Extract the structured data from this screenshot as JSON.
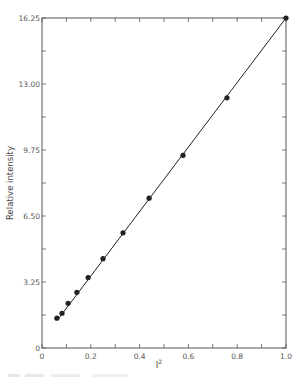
{
  "chart_data": {
    "type": "scatter",
    "title": "",
    "xlabel": "I",
    "xlabel_superscript": "2",
    "ylabel": "Relative intensity",
    "xlim": [
      0,
      1.0
    ],
    "ylim": [
      0,
      16.25
    ],
    "grid": false,
    "legend": null,
    "x_ticks": [
      0,
      0.1,
      0.2,
      0.3,
      0.4,
      0.5,
      0.6,
      0.7,
      0.8,
      0.9,
      1.0
    ],
    "x_tick_labels": [
      "0",
      "0.2",
      "0.4",
      "0.6",
      "0.8",
      "1.0"
    ],
    "x_tick_label_values": [
      0,
      0.2,
      0.4,
      0.6,
      0.8,
      1.0
    ],
    "y_ticks": [
      0,
      1.625,
      3.25,
      4.875,
      6.5,
      8.125,
      9.75,
      11.375,
      13.0,
      14.625,
      16.25
    ],
    "y_tick_labels": [
      "0",
      "3.25",
      "6.50",
      "9.75",
      "13.00",
      "16.25"
    ],
    "y_tick_label_values": [
      0,
      3.25,
      6.5,
      9.75,
      13.0,
      16.25
    ],
    "series": [
      {
        "name": "measured",
        "marker": "filled-circle",
        "line": "linear-fit",
        "x": [
          0.061,
          0.082,
          0.107,
          0.143,
          0.189,
          0.25,
          0.332,
          0.439,
          0.578,
          0.758,
          1.0
        ],
        "y": [
          1.47,
          1.71,
          2.2,
          2.74,
          3.47,
          4.4,
          5.67,
          7.38,
          9.49,
          12.32,
          16.25
        ]
      }
    ],
    "fit_line": {
      "x": [
        0.065,
        1.0
      ],
      "y": [
        1.4,
        16.25
      ]
    }
  },
  "colors": {
    "ink": "#222222",
    "axis": "#555555",
    "background": "#ffffff"
  }
}
